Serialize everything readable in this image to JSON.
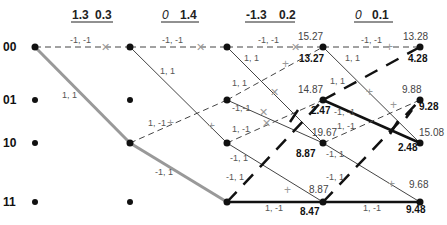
{
  "headers": [
    {
      "a": "1.3",
      "b": "0.3"
    },
    {
      "a": "0",
      "b": "1.4"
    },
    {
      "a": "-1.3",
      "b": "0.2"
    },
    {
      "a": "0",
      "b": "0.1"
    }
  ],
  "states": [
    "00",
    "01",
    "10",
    "11"
  ],
  "branch_labels": {
    "s0_00_00": "-1, -1",
    "s0_00_10": "1, 1",
    "s1_00_00": "-1, -1",
    "s1_00_10": "1, 1",
    "s1_10_01": "1, -1",
    "s1_10_11": "-1, 1",
    "s2_00_00": "-1, -1",
    "s2_00_10": "1, 1",
    "s2_01_00": "1, 1",
    "s2_01_10": "-1,-1",
    "s2_10_01": "1, -1",
    "s2_10_11": "-1, 1",
    "s2_11_01": "-1, 1",
    "s2_11_11": "1, -1",
    "s3_00_00": "-1, -1",
    "s3_00_10": "1, 1",
    "s3_01_00": "1, 1",
    "s3_01_10": "-1, -1",
    "s3_10_01": "1, -1",
    "s3_10_11": "-1, 1",
    "s3_11_01": "-1, 1",
    "s3_11_11": "1, -1"
  },
  "metrics": {
    "c3": {
      "s00_upper": "15.27",
      "s00_lower": "13.27",
      "s01_upper": "14.87",
      "s01_lower": "2.47",
      "s10_upper": "19.67",
      "s10_lower": "8.87",
      "s11_upper": "8.87",
      "s11_lower": "8.47"
    },
    "c4": {
      "s00_upper": "13.28",
      "s00_lower": "4.28",
      "s01_upper": "9.88",
      "s01_lower": "9.28",
      "s10_upper": "15.08",
      "s10_lower": "2.48",
      "s11_upper": "9.68",
      "s11_lower": "9.48"
    }
  },
  "colors": {
    "survivor_path": "#999999",
    "best_path": "#111111",
    "branch": "#333333",
    "node": "#111111"
  }
}
